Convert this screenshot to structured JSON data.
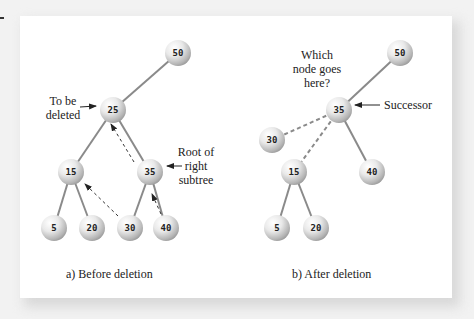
{
  "diagram": {
    "colors": {
      "edge": "#8a8a8a",
      "node_light": "#ffffff",
      "node_dark": "#9e9e9e",
      "arrow": "#222222"
    },
    "panel_a": {
      "caption": "a) Before deletion",
      "nodes": [
        {
          "id": "a50",
          "label": "50",
          "x": 178,
          "y": 53
        },
        {
          "id": "a25",
          "label": "25",
          "x": 113,
          "y": 110
        },
        {
          "id": "a15",
          "label": "15",
          "x": 71,
          "y": 172
        },
        {
          "id": "a35",
          "label": "35",
          "x": 150,
          "y": 172
        },
        {
          "id": "a5",
          "label": "5",
          "x": 54,
          "y": 228
        },
        {
          "id": "a20",
          "label": "20",
          "x": 92,
          "y": 228
        },
        {
          "id": "a30",
          "label": "30",
          "x": 130,
          "y": 228
        },
        {
          "id": "a40",
          "label": "40",
          "x": 166,
          "y": 228
        }
      ],
      "annotations": {
        "to_be_deleted_line1": "To be",
        "to_be_deleted_line2": "deleted",
        "root_right_line1": "Root of",
        "root_right_line2": "right",
        "root_right_line3": "subtree"
      }
    },
    "panel_b": {
      "caption": "b) After deletion",
      "nodes": [
        {
          "id": "b50",
          "label": "50",
          "x": 400,
          "y": 53
        },
        {
          "id": "b35",
          "label": "35",
          "x": 339,
          "y": 110
        },
        {
          "id": "b30",
          "label": "30",
          "x": 272,
          "y": 140
        },
        {
          "id": "b15",
          "label": "15",
          "x": 294,
          "y": 172
        },
        {
          "id": "b40",
          "label": "40",
          "x": 372,
          "y": 172
        },
        {
          "id": "b5",
          "label": "5",
          "x": 277,
          "y": 228
        },
        {
          "id": "b20",
          "label": "20",
          "x": 316,
          "y": 228
        }
      ],
      "annotations": {
        "question_line1": "Which",
        "question_line2": "node goes",
        "question_line3": "here?",
        "successor": "Successor"
      }
    }
  }
}
